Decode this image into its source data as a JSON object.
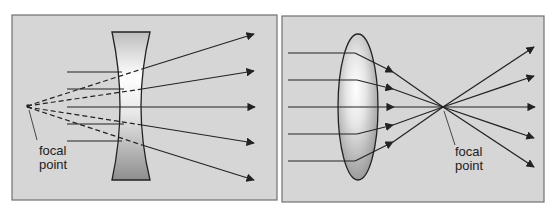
{
  "panels": [
    {
      "id": "diverging",
      "lens_type": "concave",
      "label_line1": "focal",
      "label_line2": "point"
    },
    {
      "id": "converging",
      "lens_type": "convex",
      "label_line1": "focal",
      "label_line2": "point"
    }
  ],
  "colors": {
    "panel_fill": "#d6d6d6",
    "panel_border": "#707070",
    "ray": "#222222",
    "lens_dark": "#9a9a9a",
    "lens_light": "#f8f8f8"
  }
}
